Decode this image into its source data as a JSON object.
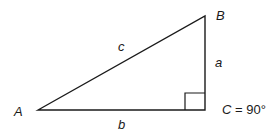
{
  "diagram": {
    "line_color": "#1a1a1a",
    "vertices": {
      "A": {
        "label": "A",
        "x": 38,
        "y": 110
      },
      "B": {
        "label": "B",
        "x": 205,
        "y": 16
      },
      "C": {
        "label": "C",
        "x": 205,
        "y": 110
      }
    },
    "sides": {
      "a": {
        "label": "a",
        "between": "B-C"
      },
      "b": {
        "label": "b",
        "between": "A-C"
      },
      "c": {
        "label": "c",
        "between": "A-B"
      }
    },
    "right_angle": {
      "vertex": "C",
      "annotation_var": "C",
      "annotation_eq": " = 90°"
    }
  }
}
